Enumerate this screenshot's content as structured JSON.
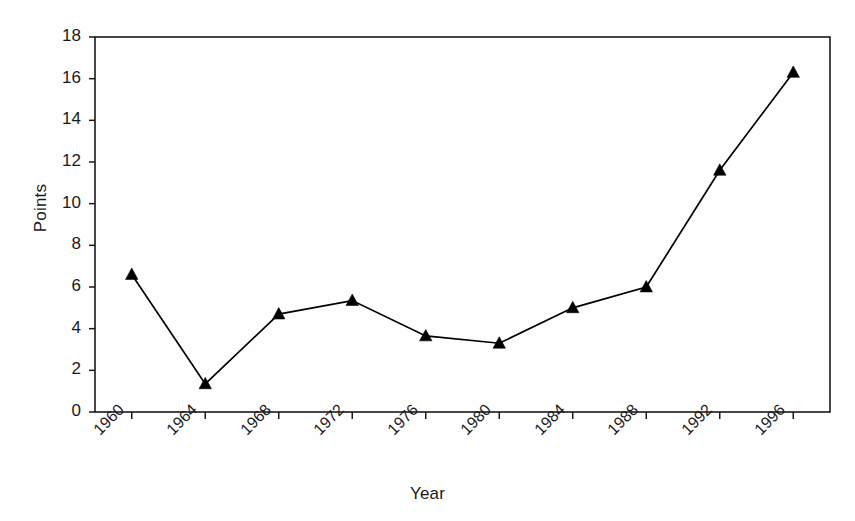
{
  "chart_data": {
    "type": "line",
    "title": "",
    "xlabel": "Year",
    "ylabel": "Points",
    "categories": [
      "1960",
      "1964",
      "1968",
      "1972",
      "1976",
      "1980",
      "1984",
      "1988",
      "1992",
      "1996"
    ],
    "x": [
      1960,
      1964,
      1968,
      1972,
      1976,
      1980,
      1984,
      1988,
      1992,
      1996
    ],
    "values": [
      6.6,
      1.35,
      4.7,
      5.35,
      3.65,
      3.3,
      5.0,
      6.0,
      11.6,
      16.3
    ],
    "series": [
      {
        "name": "Points",
        "values": [
          6.6,
          1.35,
          4.7,
          5.35,
          3.65,
          3.3,
          5.0,
          6.0,
          11.6,
          16.3
        ],
        "marker": "triangle-up",
        "color": "#000000"
      }
    ],
    "ylim": [
      0,
      18
    ],
    "yticks": [
      0,
      2,
      4,
      6,
      8,
      10,
      12,
      14,
      16,
      18
    ],
    "ytick_labels": [
      "0",
      "2",
      "4",
      "6",
      "8",
      "10",
      "12",
      "14",
      "16",
      "18"
    ],
    "xtick_labels": [
      "1960",
      "1964",
      "1968",
      "1972",
      "1976",
      "1980",
      "1984",
      "1988",
      "1992",
      "1996"
    ],
    "xtick_rotation": -45,
    "grid": false,
    "legend": false,
    "legend_position": "none",
    "line_color": "#000000",
    "marker_color": "#000000",
    "axis_color": "#000000",
    "background_color": "#fefefe"
  },
  "axes": {
    "plot_left": 95,
    "plot_right": 830,
    "plot_top": 37,
    "plot_bottom": 412
  }
}
